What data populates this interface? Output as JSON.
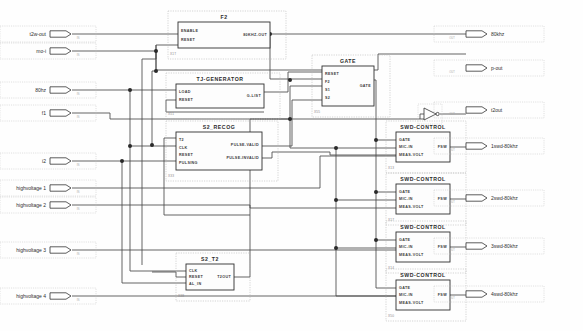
{
  "diagram": {
    "background_color": "#fefefe",
    "wire_color": "#4a4a4a",
    "block_border_color": "#303030"
  },
  "input_ports": [
    {
      "id": "in_t2wout",
      "label": "t2w-out",
      "sub": "IN",
      "x": 24,
      "y": 34
    },
    {
      "id": "in_moei",
      "label": "mo-i",
      "sub": "IN",
      "x": 24,
      "y": 51
    },
    {
      "id": "in_80hz",
      "label": "80hz",
      "sub": "IN",
      "x": 24,
      "y": 90
    },
    {
      "id": "in_f1",
      "label": "f1",
      "sub": "IN",
      "x": 24,
      "y": 113
    },
    {
      "id": "in_i2",
      "label": "i2",
      "sub": "IN",
      "x": 24,
      "y": 161
    },
    {
      "id": "in_hv1",
      "label": "highvoltage 1",
      "sub": "IN",
      "x": 24,
      "y": 188
    },
    {
      "id": "in_hv2",
      "label": "highvoltage 2",
      "sub": "IN",
      "x": 24,
      "y": 205
    },
    {
      "id": "in_hv3",
      "label": "highvoltage 3",
      "sub": "IN",
      "x": 24,
      "y": 250
    },
    {
      "id": "in_hv4",
      "label": "highvoltage 4",
      "sub": "IN",
      "x": 24,
      "y": 296
    }
  ],
  "output_ports": [
    {
      "id": "out_80khz",
      "label": "80khz",
      "sub": "OUT",
      "x": 466,
      "y": 34
    },
    {
      "id": "out_pout",
      "label": "p-out",
      "sub": "OUT",
      "x": 466,
      "y": 68
    },
    {
      "id": "out_t2out",
      "label": "t2out",
      "sub": "OUT",
      "x": 466,
      "y": 110
    },
    {
      "id": "out_swd1",
      "label": "1swd-80khz",
      "sub": "OUT",
      "x": 466,
      "y": 146
    },
    {
      "id": "out_swd2",
      "label": "2swd-80khz",
      "sub": "OUT",
      "x": 466,
      "y": 198
    },
    {
      "id": "out_swd3",
      "label": "3swd-80khz",
      "sub": "OUT",
      "x": 466,
      "y": 246
    },
    {
      "id": "out_swd4",
      "label": "4swd-80khz",
      "sub": "OUT",
      "x": 466,
      "y": 294
    }
  ],
  "blocks": [
    {
      "id": "blk_f2",
      "name": "F2",
      "ref": "X1T",
      "x": 178,
      "y": 22,
      "w": 92,
      "h": 26,
      "inputs": [
        "ENABLE",
        "RESET"
      ],
      "outputs": [
        "80KHZ-OUT"
      ]
    },
    {
      "id": "blk_tjgen",
      "name": "TJ-GENERATOR",
      "ref": "X51",
      "x": 176,
      "y": 84,
      "w": 88,
      "h": 24,
      "inputs": [
        "LOAD",
        "RESET"
      ],
      "outputs": [
        "G-LIST"
      ]
    },
    {
      "id": "blk_gate",
      "name": "GATE",
      "ref": "X55",
      "x": 322,
      "y": 66,
      "w": 52,
      "h": 40,
      "inputs": [
        "RESET",
        "F2",
        "S1",
        "S2"
      ],
      "outputs": [
        "GATE"
      ]
    },
    {
      "id": "blk_s2recog",
      "name": "S2_RECOG",
      "ref": "X33",
      "x": 176,
      "y": 132,
      "w": 86,
      "h": 38,
      "inputs": [
        "T2",
        "CLK",
        "RESET",
        "PULSING"
      ],
      "outputs": [
        "PULSE-VALID",
        "PULSE-INVALID"
      ]
    },
    {
      "id": "blk_s2t2",
      "name": "S2_T2",
      "ref": "X38",
      "x": 186,
      "y": 264,
      "w": 48,
      "h": 26,
      "inputs": [
        "CLK",
        "RESET",
        "AL_IN"
      ],
      "outputs": [
        "T2OUT"
      ]
    },
    {
      "id": "blk_swd1",
      "name": "SWD-CONTROL",
      "ref": "X13",
      "x": 396,
      "y": 132,
      "w": 54,
      "h": 30,
      "inputs": [
        "GATE",
        "MIC-IN",
        "MEAS-VOLT"
      ],
      "outputs": [
        "FSW"
      ]
    },
    {
      "id": "blk_swd2",
      "name": "SWD-CONTROL",
      "ref": "X17",
      "x": 396,
      "y": 184,
      "w": 54,
      "h": 30,
      "inputs": [
        "GATE",
        "MIC-IN",
        "MEAS-VOLT"
      ],
      "outputs": [
        "FSW"
      ]
    },
    {
      "id": "blk_swd3",
      "name": "SWD-CONTROL",
      "ref": "X14",
      "x": 396,
      "y": 232,
      "w": 54,
      "h": 30,
      "inputs": [
        "GATE",
        "MIC-IN",
        "MEAS-VOLT"
      ],
      "outputs": [
        "FSW"
      ]
    },
    {
      "id": "blk_swd4",
      "name": "SWD-CONTROL",
      "ref": "X50",
      "x": 396,
      "y": 280,
      "w": 54,
      "h": 30,
      "inputs": [
        "GATE",
        "MIC-IN",
        "MEAS-VOLT"
      ],
      "outputs": [
        "FSW"
      ]
    }
  ],
  "buffer": {
    "id": "buf_t2out",
    "name": "inverter-buffer",
    "x": 424,
    "y": 108
  }
}
